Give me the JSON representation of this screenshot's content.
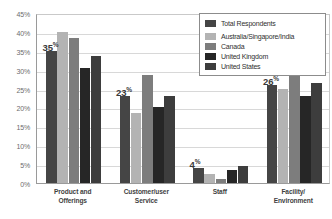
{
  "chart_data": {
    "type": "bar",
    "title": "",
    "xlabel": "",
    "ylabel": "",
    "ylim": [
      0,
      45
    ],
    "grid": true,
    "legend_position": "top-right",
    "categories": [
      "Product and Offerings",
      "Customer/user Service",
      "Staff",
      "Facility/ Environment"
    ],
    "category_lines": [
      [
        "Product and",
        "Offerings"
      ],
      [
        "Customer/user",
        "Service"
      ],
      [
        "Staff",
        ""
      ],
      [
        "Facility/",
        "Environment"
      ]
    ],
    "ytick_labels": [
      "45%",
      "40%",
      "35%",
      "30%",
      "25%",
      "20%",
      "15%",
      "10%",
      "5%",
      "0%"
    ],
    "ytick_values": [
      45,
      40,
      35,
      30,
      25,
      20,
      15,
      10,
      5,
      0
    ],
    "series": [
      {
        "name": "Total Respondents",
        "color": "#454545",
        "values": [
          35,
          23,
          4,
          26
        ]
      },
      {
        "name": "Australia/Singapore/India",
        "color": "#b3b3b3",
        "values": [
          40,
          18.5,
          2.5,
          25
        ]
      },
      {
        "name": "Canada",
        "color": "#7d7d7d",
        "values": [
          38.5,
          28.5,
          1,
          31
        ]
      },
      {
        "name": "United Kingdom",
        "color": "#262626",
        "values": [
          30.5,
          20,
          3.5,
          23
        ]
      },
      {
        "name": "United States",
        "color": "#3d3d3d",
        "values": [
          33.5,
          23,
          4.5,
          26.5
        ]
      }
    ],
    "data_labels": [
      {
        "number": "35",
        "percent": "%",
        "group": 0
      },
      {
        "number": "23",
        "percent": "%",
        "group": 1
      },
      {
        "number": "4",
        "percent": "%",
        "group": 2
      },
      {
        "number": "26",
        "percent": "%",
        "group": 3
      }
    ]
  }
}
